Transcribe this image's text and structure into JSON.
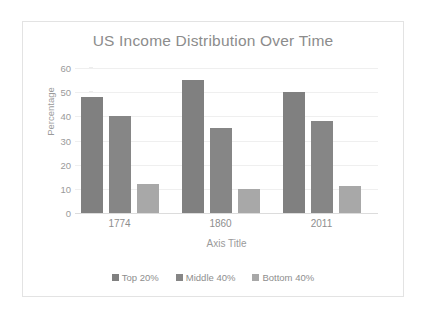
{
  "chart_data": {
    "type": "bar",
    "title": "US Income Distribution Over Time",
    "xlabel": "Axis Title",
    "ylabel": "Percentage",
    "categories": [
      "1774",
      "1860",
      "2011"
    ],
    "series": [
      {
        "name": "Top 20%",
        "values": [
          48,
          55,
          50
        ],
        "color": "#808080"
      },
      {
        "name": "Middle 40%",
        "values": [
          40,
          35,
          38
        ],
        "color": "#868686"
      },
      {
        "name": "Bottom 40%",
        "values": [
          12,
          10,
          11
        ],
        "color": "#a8a8a8"
      }
    ],
    "ylim": [
      0,
      60
    ],
    "yticks": [
      "0",
      "10",
      "20",
      "30",
      "40",
      "50",
      "60"
    ],
    "grid": true,
    "legend_position": "bottom"
  },
  "style": {
    "frame_border_color": "#e3e3e3",
    "gridline_color": "#efefef",
    "axis_color": "#dcdcdc",
    "title_color": "#8c8c8c",
    "tick_color": "#9a9a9a",
    "background": "#ffffff"
  }
}
